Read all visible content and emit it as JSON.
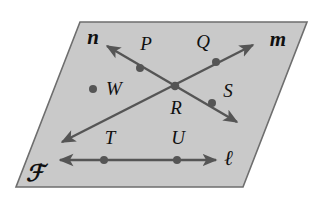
{
  "figure": {
    "kind": "geometry-plane-diagram",
    "width": 317,
    "height": 209,
    "background_color": "#ffffff"
  },
  "plane": {
    "name": "plane-F",
    "label": "ℱ",
    "label_x": 35,
    "label_y": 176,
    "fill_color": "#c9c9c9",
    "stroke_color": "#6e6e6e",
    "corners": "80,22 307,22 243,187 16,187"
  },
  "lines": [
    {
      "id": "line-l",
      "label": "ℓ",
      "label_x": 229,
      "label_y": 160,
      "x1": 60,
      "y1": 160,
      "x2": 216,
      "y2": 160,
      "arrow_start": true,
      "arrow_end": true,
      "color": "#555555",
      "description": "horizontal line through T and U"
    },
    {
      "id": "line-m",
      "label": "m",
      "label_x": 278,
      "label_y": 41,
      "x1": 62,
      "y1": 142,
      "x2": 253,
      "y2": 45,
      "arrow_start": true,
      "arrow_end": true,
      "color": "#555555",
      "description": "diagonal line rising left-to-right through R and Q"
    },
    {
      "id": "line-n",
      "label": "n",
      "label_x": 93,
      "label_y": 39,
      "x1": 107,
      "y1": 46,
      "x2": 237,
      "y2": 122,
      "arrow_start": true,
      "arrow_end": true,
      "color": "#555555",
      "description": "diagonal line falling left-to-right through P, R and S"
    }
  ],
  "points": [
    {
      "id": "point-P",
      "label": "P",
      "x": 140,
      "y": 68,
      "label_x": 146,
      "label_y": 46,
      "on_line": "line-n"
    },
    {
      "id": "point-Q",
      "label": "Q",
      "x": 216,
      "y": 62,
      "label_x": 203,
      "label_y": 44,
      "on_line": "line-m"
    },
    {
      "id": "point-R",
      "label": "R",
      "x": 175,
      "y": 86,
      "label_x": 176,
      "label_y": 110,
      "on_line": "line-m,line-n"
    },
    {
      "id": "point-S",
      "label": "S",
      "x": 212,
      "y": 103,
      "label_x": 228,
      "label_y": 93,
      "on_line": "line-n"
    },
    {
      "id": "point-T",
      "label": "T",
      "x": 104,
      "y": 160,
      "label_x": 110,
      "label_y": 140,
      "on_line": "line-l"
    },
    {
      "id": "point-U",
      "label": "U",
      "x": 177,
      "y": 160,
      "label_x": 178,
      "label_y": 140,
      "on_line": "line-l"
    },
    {
      "id": "point-W",
      "label": "W",
      "x": 93,
      "y": 89,
      "label_x": 114,
      "label_y": 91,
      "on_line": ""
    }
  ],
  "style": {
    "point_color": "#555555",
    "point_radius": 4,
    "line_width": 2.4,
    "plane_border_width": 1.6
  }
}
